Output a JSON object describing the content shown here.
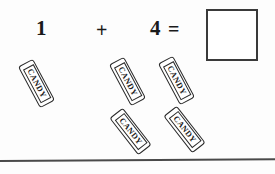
{
  "worksheet": {
    "equation": {
      "addend_1": "1",
      "plus": "+",
      "addend_2": "4",
      "equals": "=",
      "answer": ""
    },
    "candy_groups": [
      {
        "group_name": "first-addend-group",
        "count": 1,
        "items": [
          {
            "label": "CANDY"
          }
        ]
      },
      {
        "group_name": "second-addend-group",
        "count": 4,
        "items": [
          {
            "label": "CANDY"
          },
          {
            "label": "CANDY"
          },
          {
            "label": "CANDY"
          },
          {
            "label": "CANDY"
          }
        ]
      }
    ],
    "colors": {
      "ink": "#1a1a1a",
      "outline": "#2b2b2b",
      "box_border": "#3a3a3a",
      "divider": "#4a4a4a",
      "paper": "#fdfdfd"
    }
  }
}
